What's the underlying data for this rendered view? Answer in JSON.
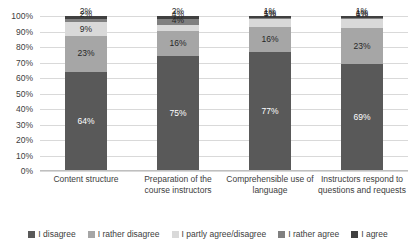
{
  "chart_data": {
    "type": "bar",
    "stacked": true,
    "stack_mode": "percent",
    "title": "",
    "subtitle": "",
    "xlabel": "",
    "ylabel": "",
    "ylim": [
      0,
      100
    ],
    "grid": true,
    "legend_position": "bottom",
    "value_suffix": "%",
    "categories": [
      "Content structure",
      "Preparation of the course instructors",
      "Comprehensible use of language",
      "Instructors respond to questions and requests"
    ],
    "ytick_labels": [
      "100%",
      "90%",
      "80%",
      "70%",
      "60%",
      "50%",
      "40%",
      "30%",
      "20%",
      "10%",
      "0%"
    ],
    "ytick_values": [
      100,
      90,
      80,
      70,
      60,
      50,
      40,
      30,
      20,
      10,
      0
    ],
    "series": [
      {
        "name": "I disagree",
        "color": "#595959",
        "label_on_dark": true,
        "values": [
          64,
          75,
          77,
          69
        ],
        "labels": [
          "64%",
          "75%",
          "77%",
          "69%"
        ]
      },
      {
        "name": "I rather disagree",
        "color": "#a6a6a6",
        "label_on_dark": false,
        "values": [
          23,
          16,
          16,
          23
        ],
        "labels": [
          "23%",
          "16%",
          "16%",
          "23%"
        ]
      },
      {
        "name": "I partly agree/disagree",
        "color": "#d9d9d9",
        "label_on_dark": false,
        "values": [
          9,
          4,
          5,
          6
        ],
        "labels": [
          "9%",
          "4%",
          "5%",
          "6%"
        ]
      },
      {
        "name": "I rather agree",
        "color": "#808080",
        "label_on_dark": false,
        "values": [
          2,
          4,
          1,
          1
        ],
        "labels": [
          "2%",
          "4%",
          "1%",
          "1%"
        ]
      },
      {
        "name": "I agree",
        "color": "#404040",
        "label_on_dark": false,
        "values": [
          2,
          2,
          1,
          1
        ],
        "labels": [
          "2%",
          "2%",
          "1%",
          "1%"
        ]
      }
    ]
  }
}
